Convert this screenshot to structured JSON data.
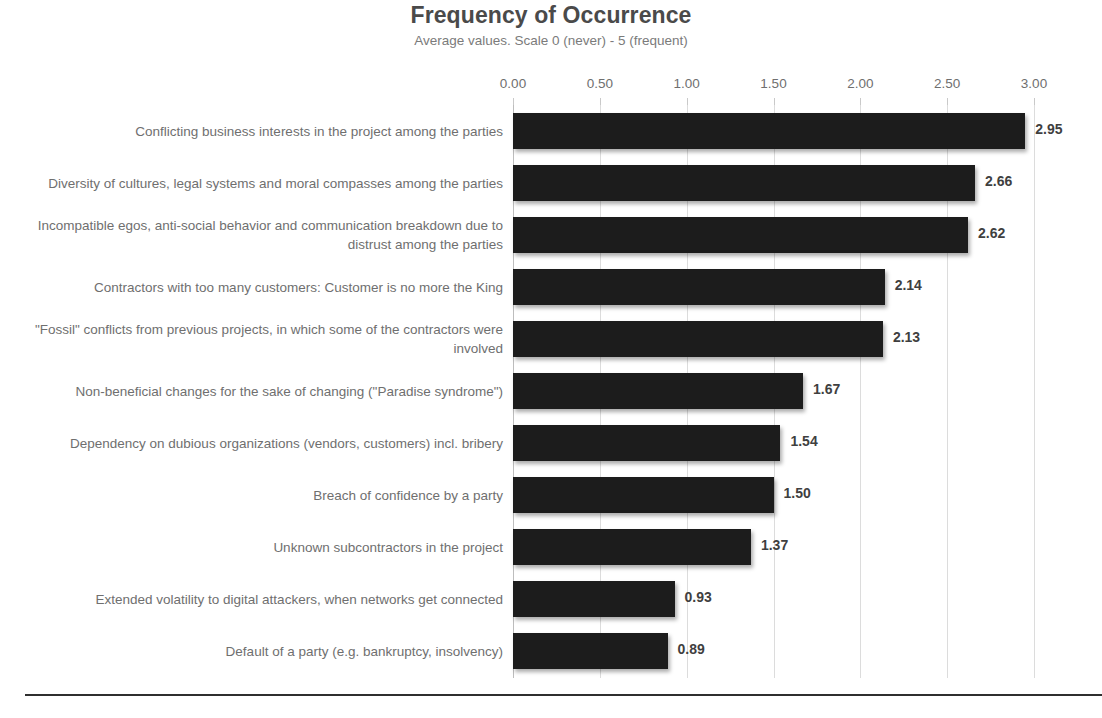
{
  "chart_data": {
    "type": "bar",
    "orientation": "horizontal",
    "title": "Frequency of Occurrence",
    "subtitle": "Average values. Scale 0 (never) - 5 (frequent)",
    "xlabel": "",
    "ylabel": "",
    "xlim": [
      0,
      3
    ],
    "grid": true,
    "axis_position": "top",
    "legend": "none",
    "tick_labels": [
      "0.00",
      "0.50",
      "1.00",
      "1.50",
      "2.00",
      "2.50",
      "3.00"
    ],
    "tick_values": [
      0,
      0.5,
      1,
      1.5,
      2,
      2.5,
      3
    ],
    "categories": [
      "Conflicting business interests in the project among the parties",
      "Diversity of cultures, legal systems and moral compasses among the parties",
      "Incompatible egos, anti-social behavior and communication breakdown due to distrust among the parties",
      "Contractors with too many customers: Customer is no more the King",
      "\"Fossil\" conflicts from previous projects, in which some of the contractors were involved",
      "Non-beneficial changes for the sake of changing (\"Paradise syndrome\")",
      "Dependency on dubious organizations (vendors, customers) incl. bribery",
      "Breach of confidence by a party",
      "Unknown subcontractors in the project",
      "Extended volatility to digital attackers, when networks get connected",
      "Default of a party (e.g. bankruptcy, insolvency)"
    ],
    "values": [
      2.95,
      2.66,
      2.62,
      2.14,
      2.13,
      1.67,
      1.54,
      1.5,
      1.37,
      0.93,
      0.89
    ],
    "value_labels": [
      "2.95",
      "2.66",
      "2.62",
      "2.14",
      "2.13",
      "1.67",
      "1.54",
      "1.50",
      "1.37",
      "0.93",
      "0.89"
    ],
    "bar_color": "#1c1c1c",
    "gridline_color": "#dcdcdc",
    "text_color": "#6f6f6f",
    "title_color": "#4a4a4a",
    "background_color": "#ffffff"
  }
}
